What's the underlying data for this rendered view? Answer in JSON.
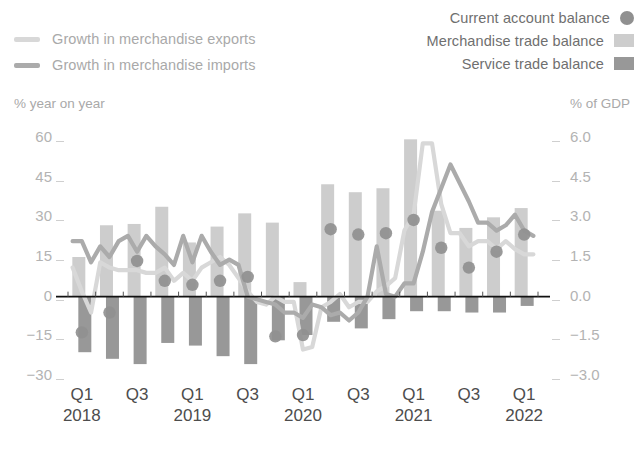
{
  "legend": {
    "left_items": [
      {
        "label": "Growth in merchandise exports",
        "color": "#d8d8d8",
        "icon": "line-swatch"
      },
      {
        "label": "Growth in merchandise imports",
        "color": "#ababab",
        "icon": "line-swatch"
      }
    ],
    "right_items": [
      {
        "label": "Current account balance",
        "color": "#909090",
        "icon": "circle-swatch"
      },
      {
        "label": "Merchandise trade balance",
        "color": "#cdcdcd",
        "icon": "rect-swatch"
      },
      {
        "label": "Service trade balance",
        "color": "#989898",
        "icon": "rect-swatch"
      }
    ]
  },
  "axes": {
    "left_caption": "% year on year",
    "right_caption": "% of GDP",
    "left_ticks": [
      "60",
      "45",
      "30",
      "15",
      "0",
      "-15",
      "-30"
    ],
    "right_ticks": [
      "6.0",
      "4.5",
      "3.0",
      "1.5",
      "0.0",
      "-1.5",
      "-3.0"
    ]
  },
  "chart_data": {
    "type": "bar",
    "title": "",
    "xlabel": "",
    "ylabel": "% year on year",
    "y2label": "% of GDP",
    "ylim": [
      -30,
      60
    ],
    "y2lim": [
      -3.0,
      6.0
    ],
    "grid": false,
    "legend_position": "top",
    "categories": [
      "Q1 2018",
      "Q2 2018",
      "Q3 2018",
      "Q4 2018",
      "Q1 2019",
      "Q2 2019",
      "Q3 2019",
      "Q4 2019",
      "Q1 2020",
      "Q2 2020",
      "Q3 2020",
      "Q4 2020",
      "Q1 2021",
      "Q2 2021",
      "Q3 2021",
      "Q4 2021",
      "Q1 2022"
    ],
    "x_tick_labels": [
      {
        "index": 0,
        "quarter": "Q1",
        "year": "2018"
      },
      {
        "index": 2,
        "quarter": "Q3",
        "year": ""
      },
      {
        "index": 4,
        "quarter": "Q1",
        "year": "2019"
      },
      {
        "index": 6,
        "quarter": "Q3",
        "year": ""
      },
      {
        "index": 8,
        "quarter": "Q1",
        "year": "2020"
      },
      {
        "index": 10,
        "quarter": "Q3",
        "year": ""
      },
      {
        "index": 12,
        "quarter": "Q1",
        "year": "2021"
      },
      {
        "index": 14,
        "quarter": "Q3",
        "year": ""
      },
      {
        "index": 16,
        "quarter": "Q1",
        "year": "2022"
      }
    ],
    "series": [
      {
        "name": "Merchandise trade balance",
        "type": "bar",
        "axis": "right",
        "unit": "% of GDP",
        "color": "#cdcdcd",
        "values": [
          1.5,
          2.7,
          2.75,
          3.4,
          2.05,
          2.65,
          3.15,
          2.8,
          0.55,
          4.25,
          3.95,
          4.1,
          5.95,
          3.25,
          2.6,
          3.0,
          3.35
        ]
      },
      {
        "name": "Service trade balance",
        "type": "bar",
        "axis": "right",
        "unit": "% of GDP",
        "color": "#989898",
        "values": [
          -2.1,
          -2.35,
          -2.55,
          -1.75,
          -1.85,
          -2.25,
          -2.55,
          -1.65,
          -1.45,
          -0.95,
          -1.2,
          -0.85,
          -0.55,
          -0.55,
          -0.6,
          -0.6,
          -0.35
        ]
      },
      {
        "name": "Current account balance",
        "type": "scatter",
        "axis": "right",
        "unit": "% of GDP",
        "color": "#909090",
        "values": [
          -1.35,
          -0.6,
          1.35,
          0.6,
          0.45,
          0.6,
          0.75,
          -1.5,
          -1.45,
          2.55,
          2.35,
          2.4,
          2.9,
          1.85,
          1.1,
          1.7,
          2.35
        ]
      }
    ],
    "line_series": [
      {
        "name": "Growth in merchandise exports",
        "type": "line",
        "axis": "left",
        "unit": "% year on year",
        "color": "#d8d8d8",
        "x_months": [
          "2018-01",
          "2018-02",
          "2018-03",
          "2018-04",
          "2018-05",
          "2018-06",
          "2018-07",
          "2018-08",
          "2018-09",
          "2018-10",
          "2018-11",
          "2018-12",
          "2019-01",
          "2019-02",
          "2019-03",
          "2019-04",
          "2019-05",
          "2019-06",
          "2019-07",
          "2019-08",
          "2019-09",
          "2019-10",
          "2019-11",
          "2019-12",
          "2020-01",
          "2020-02",
          "2020-03",
          "2020-04",
          "2020-05",
          "2020-06",
          "2020-07",
          "2020-08",
          "2020-09",
          "2020-10",
          "2020-11",
          "2020-12",
          "2021-01",
          "2021-02",
          "2021-03",
          "2021-04",
          "2021-05",
          "2021-06",
          "2021-07",
          "2021-08",
          "2021-09",
          "2021-10",
          "2021-11",
          "2021-12",
          "2022-01",
          "2022-02",
          "2022-03"
        ],
        "values": [
          11,
          2,
          -6,
          13,
          11,
          10,
          10,
          10,
          9,
          9,
          11,
          6,
          9,
          6,
          11,
          13,
          15,
          12,
          7,
          2,
          -2,
          -3,
          0,
          -2,
          -2,
          -20,
          -19,
          -4,
          -2,
          1,
          -4,
          -2,
          -2,
          2,
          4,
          7,
          25,
          31,
          58,
          58,
          35,
          24,
          24,
          19,
          21,
          21,
          18,
          21,
          18,
          16,
          16
        ]
      },
      {
        "name": "Growth in merchandise imports",
        "type": "line",
        "axis": "left",
        "unit": "% year on year",
        "color": "#ababab",
        "x_months": [
          "2018-01",
          "2018-02",
          "2018-03",
          "2018-04",
          "2018-05",
          "2018-06",
          "2018-07",
          "2018-08",
          "2018-09",
          "2018-10",
          "2018-11",
          "2018-12",
          "2019-01",
          "2019-02",
          "2019-03",
          "2019-04",
          "2019-05",
          "2019-06",
          "2019-07",
          "2019-08",
          "2019-09",
          "2019-10",
          "2019-11",
          "2019-12",
          "2020-01",
          "2020-02",
          "2020-03",
          "2020-04",
          "2020-05",
          "2020-06",
          "2020-07",
          "2020-08",
          "2020-09",
          "2020-10",
          "2020-11",
          "2020-12",
          "2021-01",
          "2021-02",
          "2021-03",
          "2021-04",
          "2021-05",
          "2021-06",
          "2021-07",
          "2021-08",
          "2021-09",
          "2021-10",
          "2021-11",
          "2021-12",
          "2022-01",
          "2022-02",
          "2022-03"
        ],
        "values": [
          21,
          21,
          13,
          19,
          15,
          21,
          23,
          17,
          23,
          19,
          16,
          12,
          23,
          13,
          23,
          17,
          12,
          14,
          12,
          0,
          -1,
          -2,
          -3,
          -6,
          -6,
          -8,
          -3,
          -4,
          -7,
          -6,
          -9,
          -6,
          0,
          19,
          1,
          0,
          5,
          5,
          17,
          32,
          41,
          50,
          43,
          36,
          28,
          28,
          25,
          27,
          31,
          25,
          23
        ]
      }
    ]
  }
}
